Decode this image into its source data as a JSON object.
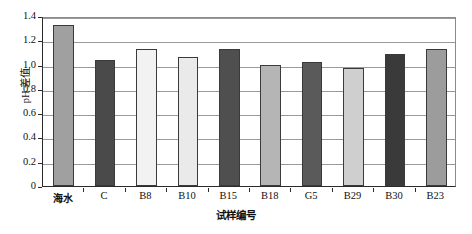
{
  "chart_data": {
    "type": "bar",
    "title": "",
    "xlabel": "试样编号",
    "ylabel": "pH 差值",
    "categories": [
      "海水",
      "C",
      "B8",
      "B10",
      "B15",
      "B18",
      "G5",
      "B29",
      "B30",
      "B23"
    ],
    "values": [
      1.33,
      1.04,
      1.13,
      1.06,
      1.13,
      1.0,
      1.02,
      0.97,
      1.09,
      1.13
    ],
    "ylim": [
      0,
      1.4
    ],
    "ytick_labels": [
      "1.4",
      "1.2",
      "1.0",
      "0.8",
      "0.6",
      "0.4",
      "0.2",
      "0"
    ],
    "ytick_values": [
      1.4,
      1.2,
      1.0,
      0.8,
      0.6,
      0.4,
      0.2,
      0
    ],
    "grid": true,
    "legend": "none",
    "bar_colors": [
      "#a0a0a0",
      "#4a4a4a",
      "#f2f2f2",
      "#eaeaea",
      "#4f4f4f",
      "#b5b5b5",
      "#5a5a5a",
      "#cfcfcf",
      "#3a3a3a",
      "#9c9c9c"
    ],
    "bar_edge_color": "#3a3a3a",
    "gridline_color": "#9a9a9a",
    "axis_color": "#2b2b2b",
    "background": "#ffffff"
  }
}
